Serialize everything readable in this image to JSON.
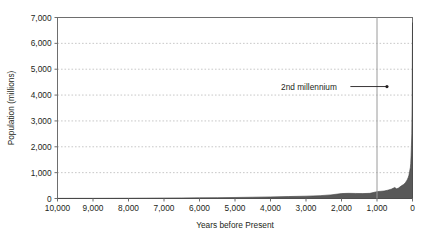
{
  "chart_data": {
    "type": "area",
    "title": "",
    "subtitle": "",
    "xlabel": "Years before Present",
    "ylabel": "Population (millions)",
    "xlim": [
      10000,
      0
    ],
    "ylim": [
      0,
      7000
    ],
    "x_reversed": true,
    "grid": true,
    "grid_axis": "y",
    "grid_style": "dotted",
    "legend": "none",
    "xticks": [
      10000,
      9000,
      8000,
      7000,
      6000,
      5000,
      4000,
      3000,
      2000,
      1000,
      0
    ],
    "xtick_labels": [
      "10,000",
      "9,000",
      "8,000",
      "7,000",
      "6,000",
      "5,000",
      "4,000",
      "3,000",
      "2,000",
      "1,000",
      "0"
    ],
    "yticks": [
      0,
      1000,
      2000,
      3000,
      4000,
      5000,
      6000,
      7000
    ],
    "ytick_labels": [
      "0",
      "1,000",
      "2,000",
      "3,000",
      "4,000",
      "5,000",
      "6,000",
      "7,000"
    ],
    "series": [
      {
        "name": "World population",
        "fill_color": "#595959",
        "line_color": "#404040",
        "x": [
          10000,
          9500,
          9000,
          8500,
          8000,
          7500,
          7000,
          6500,
          6000,
          5500,
          5000,
          4500,
          4000,
          3500,
          3000,
          2600,
          2300,
          2000,
          1800,
          1600,
          1400,
          1200,
          1000,
          800,
          700,
          600,
          500,
          450,
          400,
          350,
          300,
          250,
          200,
          150,
          120,
          100,
          80,
          60,
          50,
          40,
          30,
          20,
          10,
          0
        ],
        "y": [
          5,
          6,
          7,
          9,
          11,
          14,
          18,
          22,
          27,
          33,
          40,
          50,
          62,
          75,
          90,
          110,
          140,
          190,
          200,
          195,
          190,
          200,
          265,
          290,
          320,
          360,
          425,
          375,
          400,
          450,
          500,
          545,
          610,
          720,
          815,
          900,
          1050,
          1200,
          1350,
          1650,
          2070,
          2500,
          3700,
          6800
        ],
        "y_unit": "millions"
      }
    ],
    "annotations": [
      {
        "name": "2nd-millennium-annotation",
        "text": "2nd millennium",
        "text_x": 2130,
        "text_y": 4330,
        "arrow_from_x": 1750,
        "arrow_from_y": 4330,
        "arrow_to_x": 720,
        "arrow_to_y": 4330,
        "marker": "dot"
      }
    ],
    "reference_lines": [
      {
        "name": "millennium-reference-line",
        "orientation": "vertical",
        "x": 1000,
        "color": "#9a9a9a"
      }
    ]
  },
  "figure": {
    "background": "#ffffff",
    "frame_color": "#6e6e6e",
    "gridline_color": "#c8c8c8",
    "text_color": "#231f20"
  }
}
